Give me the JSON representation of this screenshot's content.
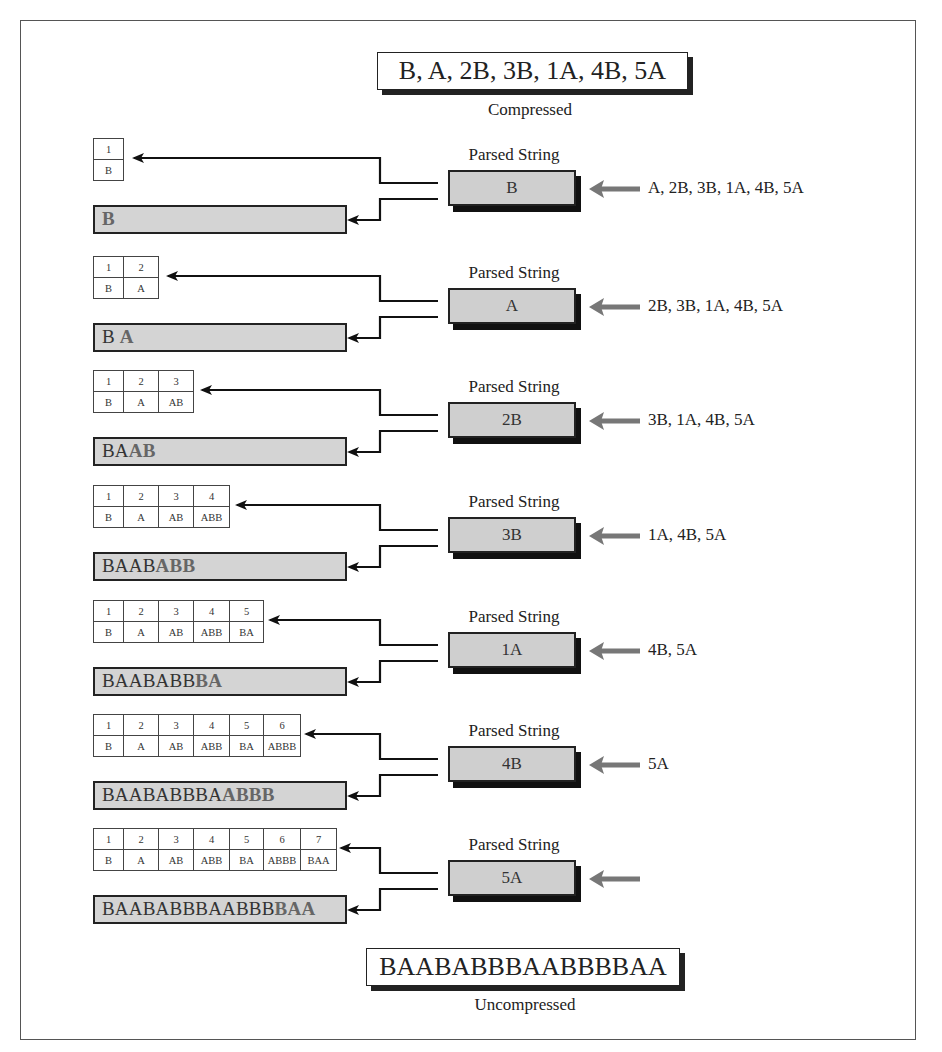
{
  "title": {
    "compressed_text": "B, A, 2B, 3B, 1A, 4B, 5A",
    "compressed_caption": "Compressed",
    "uncompressed_text": "BAABABBBAABBBBAA",
    "uncompressed_caption": "Uncompressed"
  },
  "parsed_label": "Parsed String",
  "colors": {
    "box_fill": "#cfcfcf",
    "bar_fill": "#d4d4d4",
    "gray_arrow": "#777777",
    "outline": "#222222"
  },
  "steps": [
    {
      "parsed": "B",
      "remaining": "A, 2B, 3B, 1A, 4B, 5A",
      "dictionary": [
        {
          "index": "1",
          "entry": "B"
        }
      ],
      "output_prev": "",
      "output_new": "B"
    },
    {
      "parsed": "A",
      "remaining": "2B, 3B, 1A, 4B, 5A",
      "dictionary": [
        {
          "index": "1",
          "entry": "B"
        },
        {
          "index": "2",
          "entry": "A"
        }
      ],
      "output_prev": "B ",
      "output_new": "A"
    },
    {
      "parsed": "2B",
      "remaining": "3B, 1A, 4B, 5A",
      "dictionary": [
        {
          "index": "1",
          "entry": "B"
        },
        {
          "index": "2",
          "entry": "A"
        },
        {
          "index": "3",
          "entry": "AB"
        }
      ],
      "output_prev": "BA",
      "output_new": "AB"
    },
    {
      "parsed": "3B",
      "remaining": "1A, 4B, 5A",
      "dictionary": [
        {
          "index": "1",
          "entry": "B"
        },
        {
          "index": "2",
          "entry": "A"
        },
        {
          "index": "3",
          "entry": "AB"
        },
        {
          "index": "4",
          "entry": "ABB"
        }
      ],
      "output_prev": "BAAB",
      "output_new": "ABB"
    },
    {
      "parsed": "1A",
      "remaining": "4B, 5A",
      "dictionary": [
        {
          "index": "1",
          "entry": "B"
        },
        {
          "index": "2",
          "entry": "A"
        },
        {
          "index": "3",
          "entry": "AB"
        },
        {
          "index": "4",
          "entry": "ABB"
        },
        {
          "index": "5",
          "entry": "BA"
        }
      ],
      "output_prev": "BAABABB",
      "output_new": "BA"
    },
    {
      "parsed": "4B",
      "remaining": "5A",
      "dictionary": [
        {
          "index": "1",
          "entry": "B"
        },
        {
          "index": "2",
          "entry": "A"
        },
        {
          "index": "3",
          "entry": "AB"
        },
        {
          "index": "4",
          "entry": "ABB"
        },
        {
          "index": "5",
          "entry": "BA"
        },
        {
          "index": "6",
          "entry": "ABBB"
        }
      ],
      "output_prev": "BAABABBBA",
      "output_new": "ABBB"
    },
    {
      "parsed": "5A",
      "remaining": "",
      "dictionary": [
        {
          "index": "1",
          "entry": "B"
        },
        {
          "index": "2",
          "entry": "A"
        },
        {
          "index": "3",
          "entry": "AB"
        },
        {
          "index": "4",
          "entry": "ABB"
        },
        {
          "index": "5",
          "entry": "BA"
        },
        {
          "index": "6",
          "entry": "ABBB"
        },
        {
          "index": "7",
          "entry": "BAA"
        }
      ],
      "output_prev": "BAABABBBAABBB",
      "output_new": "BAA"
    }
  ]
}
